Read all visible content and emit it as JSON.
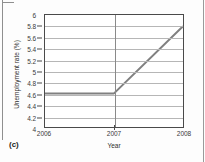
{
  "figure": {
    "panel_label": "(c)"
  },
  "chart_data": {
    "type": "line",
    "title": "",
    "xlabel": "Year",
    "ylabel": "Unemployment rate (%)",
    "xlim": [
      2006,
      2008
    ],
    "ylim": [
      4,
      6
    ],
    "grid": true,
    "legend": "none",
    "x_ticks": [
      2006,
      2007,
      2008
    ],
    "x_tick_labels": [
      "2006",
      "2007",
      "2008"
    ],
    "y_ticks": [
      4,
      4.2,
      4.4,
      4.6,
      4.8,
      5,
      5.2,
      5.4,
      5.6,
      5.8,
      6
    ],
    "y_tick_labels": [
      "4",
      "4.2",
      "4.4",
      "4.6",
      "4.8",
      "5",
      "5.2",
      "5.4",
      "5.6",
      "5.8",
      "6"
    ],
    "series": [
      {
        "name": "Unemployment rate",
        "color": "#808080",
        "x": [
          2006,
          2007,
          2008
        ],
        "values": [
          4.6,
          4.6,
          5.8
        ]
      }
    ],
    "annotations": []
  }
}
